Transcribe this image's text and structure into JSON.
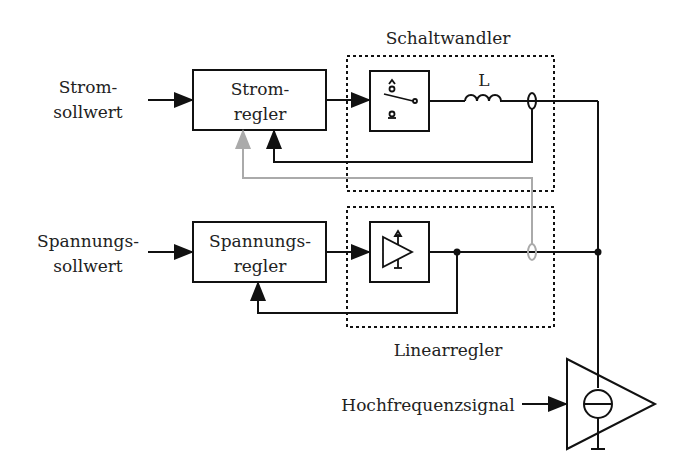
{
  "diagram": {
    "title_switch": "Schaltwandler",
    "title_linear": "Linearregler",
    "inputs": {
      "strom_line1": "Strom-",
      "strom_line2": "sollwert",
      "spannung_line1": "Spannungs-",
      "spannung_line2": "sollwert",
      "hf": "Hochfrequenzsignal"
    },
    "blocks": {
      "stromregler_line1": "Strom-",
      "stromregler_line2": "regler",
      "spannungsregler_line1": "Spannungs-",
      "spannungsregler_line2": "regler"
    },
    "inductor_label": "L",
    "colors": {
      "line": "#111111",
      "feedback_gray": "#aaaaaa",
      "text": "#222222"
    }
  }
}
